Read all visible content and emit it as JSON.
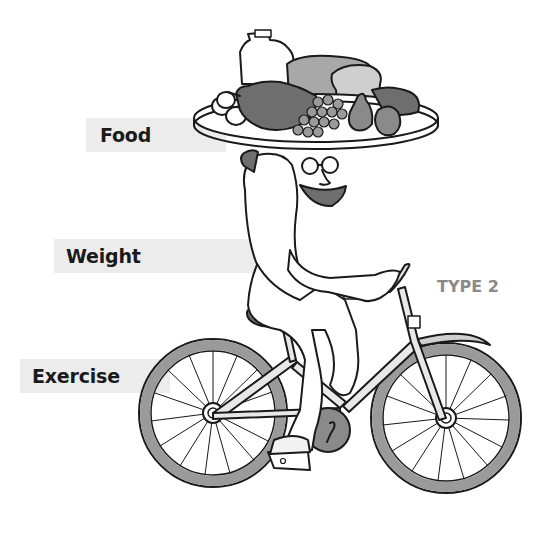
{
  "labels": {
    "food": "Food",
    "weight": "Weight",
    "exercise": "Exercise",
    "type": "TYPE 2"
  },
  "illustration": {
    "subject": "character-balancing-food-platter-on-head-riding-bicycle",
    "platter_items": [
      "milk-jug",
      "roast-chicken",
      "eggs",
      "grapes",
      "bread-loaf",
      "pear",
      "apple",
      "steak"
    ],
    "colors": {
      "line": "#1a1a1a",
      "label_bar": "#ececec",
      "type_text": "#8a8a8a",
      "tire": "#9a9a9a",
      "dark_fill": "#6e6e6e",
      "mid_fill": "#a8a8a8",
      "light_fill": "#cfcfcf"
    }
  }
}
